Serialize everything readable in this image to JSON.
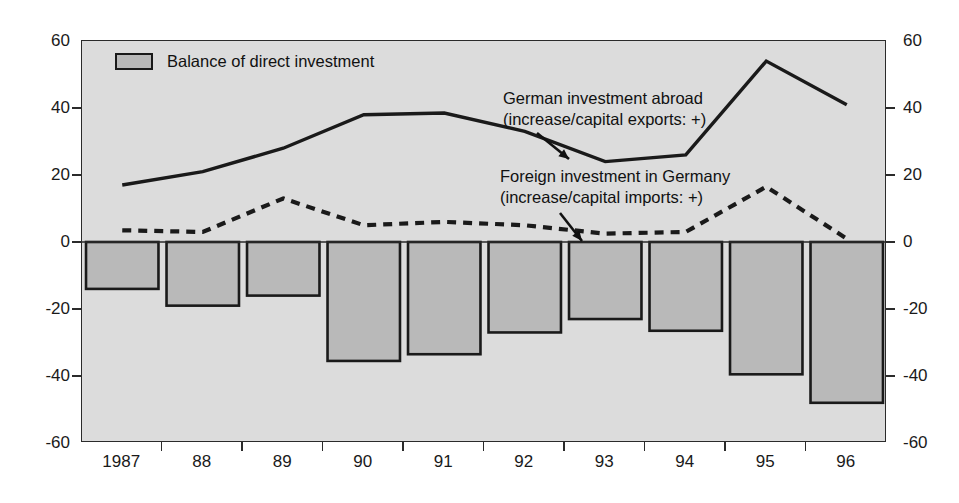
{
  "chart_data": {
    "type": "bar",
    "title": "",
    "subtitle": "",
    "xlabel": "",
    "ylabel": "",
    "ylim": [
      -60,
      60
    ],
    "yticks": [
      60,
      40,
      20,
      0,
      -20,
      -40,
      -60
    ],
    "ytick_labels_left": [
      "60",
      "40",
      "20",
      "0",
      "-20",
      "-40",
      "-60"
    ],
    "ytick_labels_right": [
      "60",
      "40",
      "20",
      "0",
      "-20",
      "-40",
      "-60"
    ],
    "grid": false,
    "legend_position": "top-left",
    "categories": [
      "1987",
      "88",
      "89",
      "90",
      "91",
      "92",
      "93",
      "94",
      "95",
      "96"
    ],
    "xtick_labels": [
      "1987",
      "88",
      "89",
      "90",
      "91",
      "92",
      "93",
      "94",
      "95",
      "96"
    ],
    "series": [
      {
        "name": "Balance of direct investment",
        "type": "bar",
        "values": [
          -14,
          -19,
          -16,
          -35.5,
          -33.5,
          -27,
          -23,
          -26.5,
          -39.5,
          -48
        ],
        "fill_color": "#b9b9b9",
        "edge_color": "#1a1a1a"
      },
      {
        "name": "German investment abroad (increase/capital exports: +)",
        "type": "line",
        "style": "solid",
        "values": [
          17,
          21,
          28,
          38,
          38.5,
          33,
          24,
          26,
          54,
          41
        ],
        "color": "#1a1a1a"
      },
      {
        "name": "Foreign investment in Germany (increase/capital imports: +)",
        "type": "line",
        "style": "dashed",
        "values": [
          3.5,
          3,
          13,
          5,
          6,
          5,
          2.5,
          3,
          16.5,
          1
        ],
        "color": "#1a1a1a"
      }
    ],
    "annotations": [
      {
        "id": "german-investment-abroad",
        "line1": "German investment abroad",
        "line2": "(increase/capital exports: +)",
        "arrow": true
      },
      {
        "id": "foreign-investment-in-germany",
        "line1": "Foreign investment in Germany",
        "line2": "(increase/capital imports: +)",
        "arrow": true
      }
    ]
  },
  "legend": {
    "swatch_label": "Balance of direct investment"
  },
  "colors": {
    "plot_background": "#dcdcdc",
    "page_background": "#ffffff",
    "bar_fill": "#b9b9b9",
    "ink": "#1a1a1a"
  }
}
